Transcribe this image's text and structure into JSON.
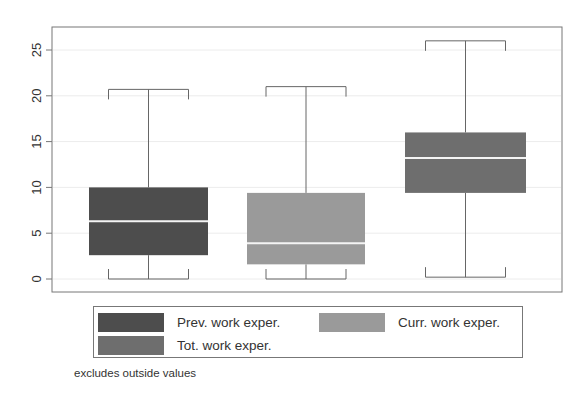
{
  "chart_data": {
    "type": "box",
    "title": "",
    "xlabel": "",
    "ylabel": "",
    "ylim": [
      0,
      27
    ],
    "yticks": [
      0,
      5,
      10,
      15,
      20,
      25
    ],
    "grid": true,
    "legend_position": "bottom",
    "series": [
      {
        "name": "Prev. work exper.",
        "color": "#4d4d4d",
        "whisker_low": 0,
        "q1": 2.6,
        "median": 6.3,
        "q3": 10,
        "whisker_high": 20.7
      },
      {
        "name": "Curr. work exper.",
        "color": "#9a9a9a",
        "whisker_low": 0,
        "q1": 1.6,
        "median": 3.9,
        "q3": 9.4,
        "whisker_high": 21
      },
      {
        "name": "Tot. work exper.",
        "color": "#6e6e6e",
        "whisker_low": 0.2,
        "q1": 9.4,
        "median": 13.2,
        "q3": 16,
        "whisker_high": 26
      }
    ],
    "note": "excludes outside values"
  },
  "legend": {
    "items": [
      {
        "label": "Prev. work exper.",
        "color": "#4d4d4d"
      },
      {
        "label": "Curr. work exper.",
        "color": "#9a9a9a"
      },
      {
        "label": "Tot. work exper.",
        "color": "#6e6e6e"
      }
    ]
  },
  "footnote": "excludes outside values"
}
